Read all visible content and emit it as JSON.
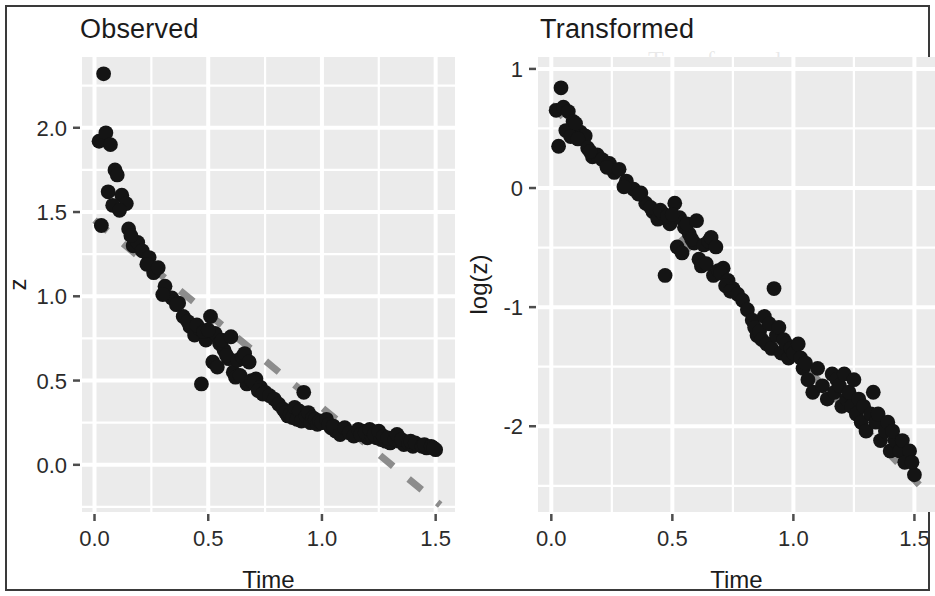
{
  "figure": {
    "width": 935,
    "height": 596,
    "background": "#ffffff",
    "frame_color": "#3a3a3a"
  },
  "style": {
    "panel_fill": "#ebebeb",
    "gridline_color": "#ffffff",
    "point_color": "#141414",
    "fit_line_color": "#8c8c8c",
    "text_color": "#1b1b1b"
  },
  "panels": [
    {
      "key": "observed",
      "title": "Observed",
      "xlabel": "Time",
      "ylabel": "z"
    },
    {
      "key": "transformed",
      "title": "Transformed",
      "xlabel": "Time",
      "ylabel": "log(z)"
    }
  ],
  "bleed_text": [
    {
      "text": "Transformed",
      "x": 648,
      "y": 46,
      "size": 26
    },
    {
      "text": "Regression on Tra",
      "x": 612,
      "y": 418,
      "size": 27
    },
    {
      "text": "model",
      "x": 640,
      "y": 196,
      "size": 22
    },
    {
      "text": "ANOVA",
      "x": 612,
      "y": 470,
      "size": 22
    }
  ],
  "chart_data": [
    {
      "type": "scatter",
      "panel": "observed",
      "title": "Observed",
      "xlabel": "Time",
      "ylabel": "z",
      "xlim": [
        -0.055,
        1.585
      ],
      "ylim": [
        -0.28,
        2.42
      ],
      "xticks": [
        0.0,
        0.5,
        1.0,
        1.5
      ],
      "xtick_labels": [
        "0.0",
        "0.5",
        "1.0",
        "1.5"
      ],
      "yticks": [
        0.0,
        0.5,
        1.0,
        1.5,
        2.0
      ],
      "ytick_labels": [
        "0.0",
        "0.5",
        "1.0",
        "1.5",
        "2.0"
      ],
      "grid": true,
      "minor_grid": true,
      "legend": "none",
      "fit_line": {
        "style": "dashed",
        "color": "#8c8c8c",
        "intercept": 1.452,
        "slope": -1.112,
        "x_start": 0.0,
        "x_end": 1.52
      },
      "x": [
        0.04,
        0.02,
        0.05,
        0.07,
        0.09,
        0.06,
        0.12,
        0.1,
        0.08,
        0.14,
        0.11,
        0.03,
        0.15,
        0.17,
        0.19,
        0.21,
        0.16,
        0.24,
        0.26,
        0.23,
        0.28,
        0.31,
        0.34,
        0.3,
        0.37,
        0.39,
        0.36,
        0.42,
        0.44,
        0.41,
        0.46,
        0.47,
        0.49,
        0.45,
        0.51,
        0.48,
        0.53,
        0.5,
        0.55,
        0.52,
        0.57,
        0.54,
        0.59,
        0.56,
        0.61,
        0.58,
        0.63,
        0.6,
        0.65,
        0.62,
        0.67,
        0.64,
        0.69,
        0.66,
        0.71,
        0.68,
        0.7,
        0.73,
        0.72,
        0.75,
        0.74,
        0.77,
        0.79,
        0.81,
        0.83,
        0.85,
        0.84,
        0.86,
        0.87,
        0.88,
        0.89,
        0.9,
        0.91,
        0.92,
        0.93,
        0.94,
        0.95,
        0.96,
        0.97,
        0.98,
        0.99,
        1.0,
        1.02,
        1.04,
        1.03,
        1.06,
        1.05,
        1.08,
        1.1,
        1.12,
        1.14,
        1.16,
        1.18,
        1.17,
        1.2,
        1.19,
        1.22,
        1.21,
        1.24,
        1.23,
        1.26,
        1.25,
        1.28,
        1.27,
        1.3,
        1.29,
        1.32,
        1.34,
        1.33,
        1.36,
        1.35,
        1.38,
        1.4,
        1.39,
        1.42,
        1.41,
        1.44,
        1.46,
        1.45,
        1.48,
        1.5,
        1.49
      ],
      "y": [
        2.32,
        1.92,
        1.97,
        1.9,
        1.75,
        1.62,
        1.6,
        1.72,
        1.54,
        1.55,
        1.51,
        1.42,
        1.4,
        1.3,
        1.32,
        1.27,
        1.36,
        1.23,
        1.14,
        1.19,
        1.17,
        1.06,
        0.99,
        1.01,
        0.96,
        0.88,
        0.95,
        0.82,
        0.77,
        0.85,
        0.81,
        0.48,
        0.74,
        0.83,
        0.88,
        0.79,
        0.78,
        0.8,
        0.72,
        0.61,
        0.68,
        0.58,
        0.63,
        0.74,
        0.55,
        0.65,
        0.62,
        0.76,
        0.64,
        0.52,
        0.48,
        0.53,
        0.5,
        0.66,
        0.51,
        0.61,
        0.49,
        0.46,
        0.44,
        0.43,
        0.42,
        0.41,
        0.39,
        0.36,
        0.33,
        0.29,
        0.31,
        0.3,
        0.28,
        0.34,
        0.27,
        0.32,
        0.26,
        0.43,
        0.29,
        0.31,
        0.25,
        0.28,
        0.27,
        0.24,
        0.26,
        0.25,
        0.27,
        0.22,
        0.24,
        0.2,
        0.23,
        0.18,
        0.22,
        0.19,
        0.17,
        0.21,
        0.2,
        0.18,
        0.16,
        0.19,
        0.17,
        0.21,
        0.16,
        0.18,
        0.15,
        0.2,
        0.14,
        0.17,
        0.13,
        0.16,
        0.15,
        0.14,
        0.18,
        0.12,
        0.15,
        0.13,
        0.11,
        0.14,
        0.12,
        0.13,
        0.11,
        0.1,
        0.12,
        0.11,
        0.09,
        0.1
      ]
    },
    {
      "type": "scatter",
      "panel": "transformed",
      "title": "Transformed",
      "xlabel": "Time",
      "ylabel": "log(z)",
      "xlim": [
        -0.055,
        1.585
      ],
      "ylim": [
        -2.72,
        1.1
      ],
      "xticks": [
        0.0,
        0.5,
        1.0,
        1.5
      ],
      "xtick_labels": [
        "0.0",
        "0.5",
        "1.0",
        "1.5"
      ],
      "yticks": [
        -2,
        -1,
        0,
        1
      ],
      "ytick_labels": [
        "-2",
        "-1",
        "0",
        "1"
      ],
      "grid": true,
      "minor_grid": true,
      "legend": "none",
      "fit_line": {
        "style": "dashed",
        "color": "#8c8c8c",
        "intercept": 0.7,
        "slope": -2.1,
        "x_start": 0.0,
        "x_end": 1.52
      },
      "note": "y values are natural log of the Observed panel z values",
      "derived_from": "observed"
    }
  ]
}
